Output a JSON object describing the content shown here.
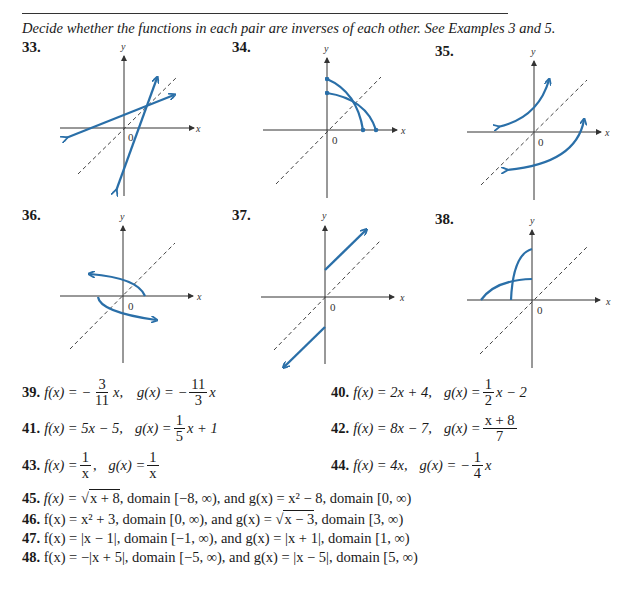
{
  "header": {
    "instructions": "Decide whether the functions in each pair are inverses of each other. See Examples 3 and 5."
  },
  "graph_problems": [
    {
      "number": "33.",
      "description": "Two straight lines with arrows intersecting on dashed line y = x"
    },
    {
      "number": "34.",
      "description": "Two quarter-arc curves with endpoints on axes in first quadrant, intersecting on y = x"
    },
    {
      "number": "35.",
      "description": "Two increasing curves with arrows, one above and one below y = x"
    },
    {
      "number": "36.",
      "description": "Two curved rays starting near the origin, reflected over y = x"
    },
    {
      "number": "37.",
      "description": "Two parallel line rays, one starting on positive y-axis, one on negative y-axis"
    },
    {
      "number": "38.",
      "description": "Two curves in second quadrant starting on negative x-axis and ending on positive y-axis"
    }
  ],
  "axis_labels": {
    "x": "x",
    "y": "y",
    "origin": "0"
  },
  "colors": {
    "curve": "#2a6fa8",
    "axis": "#333333",
    "dashed": "#444444"
  },
  "equations": {
    "p39": {
      "num": "39.",
      "f_lhs": "f(x) = −",
      "f_num": "3",
      "f_den": "11",
      "f_tail": "x,",
      "g_lhs": "g(x) = −",
      "g_num": "11",
      "g_den": "3",
      "g_tail": "x"
    },
    "p40": {
      "num": "40.",
      "f": "f(x) = 2x + 4,",
      "g_lhs": "g(x) =",
      "g_num": "1",
      "g_den": "2",
      "g_tail": "x − 2"
    },
    "p41": {
      "num": "41.",
      "f": "f(x) = 5x − 5,",
      "g_lhs": "g(x) =",
      "g_num": "1",
      "g_den": "5",
      "g_tail": "x + 1"
    },
    "p42": {
      "num": "42.",
      "f": "f(x) = 8x − 7,",
      "g_lhs": "g(x) =",
      "g_num": "x + 8",
      "g_den": "7"
    },
    "p43": {
      "num": "43.",
      "f_lhs": "f(x) =",
      "f_num": "1",
      "f_den": "x",
      "f_tail": ",",
      "g_lhs": "g(x) =",
      "g_num": "1",
      "g_den": "x"
    },
    "p44": {
      "num": "44.",
      "f": "f(x) = 4x,",
      "g_lhs": "g(x) = −",
      "g_num": "1",
      "g_den": "4",
      "g_tail": "x"
    }
  },
  "domain_problems": [
    {
      "num": "45.",
      "f_pre": "f(x) = ",
      "f_sqrt": "x + 8",
      "f_post": ", domain [−8, ∞), and g(x) = x² − 8, domain [0, ∞)"
    },
    {
      "num": "46.",
      "text_pre": "f(x) = x² + 3, domain [0, ∞), and g(x) = ",
      "g_sqrt": "x − 3",
      "text_post": ", domain [3, ∞)"
    },
    {
      "num": "47.",
      "text": "f(x) = |x − 1|, domain [−1, ∞), and g(x) = |x + 1|, domain [1, ∞)"
    },
    {
      "num": "48.",
      "text": "f(x) = −|x + 5|, domain [−5, ∞), and g(x) = |x − 5|, domain [5, ∞)"
    }
  ]
}
